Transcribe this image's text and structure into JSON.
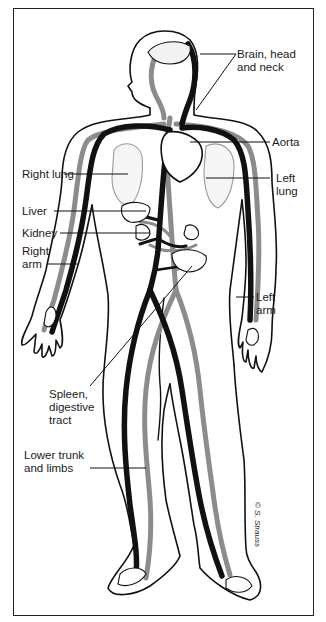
{
  "figure": {
    "colors": {
      "artery": "#111111",
      "vein": "#8c8c8c",
      "outline": "#111111",
      "background": "#ffffff"
    },
    "labels": {
      "brain": {
        "line1": "Brain, head",
        "line2": "and neck"
      },
      "aorta": {
        "line1": "Aorta"
      },
      "right_lung": {
        "line1": "Right lung"
      },
      "left_lung": {
        "line1": "Left",
        "line2": "lung"
      },
      "liver": {
        "line1": "Liver"
      },
      "kidney": {
        "line1": "Kidney"
      },
      "right_arm": {
        "line1": "Right",
        "line2": "arm"
      },
      "left_arm": {
        "line1": "Left",
        "line2": "arm"
      },
      "spleen": {
        "line1": "Spleen,",
        "line2": "digestive",
        "line3": "tract"
      },
      "lower": {
        "line1": "Lower trunk",
        "line2": "and limbs"
      }
    },
    "signature": "© S. Strauss"
  }
}
